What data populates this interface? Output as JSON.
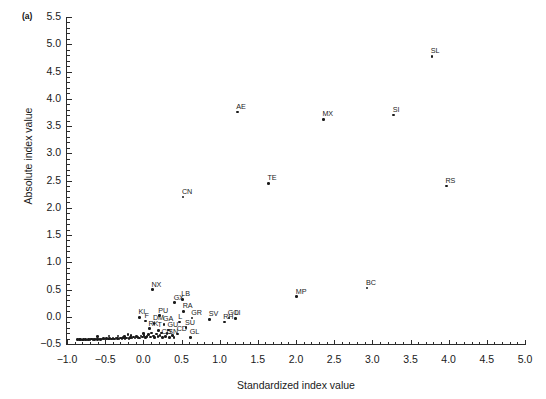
{
  "panel": {
    "label": "(a)"
  },
  "chart_data": {
    "type": "scatter",
    "title": "",
    "panel_label": "(a)",
    "xlabel": "Standardized index value",
    "ylabel": "Absolute index value",
    "xlim": [
      -1.0,
      5.0
    ],
    "ylim": [
      -0.5,
      5.5
    ],
    "xticks": [
      "-1.0",
      "-0.5",
      "0.0",
      "0.5",
      "1.0",
      "1.5",
      "2.0",
      "2.5",
      "3.0",
      "3.5",
      "4.0",
      "4.5",
      "5.0"
    ],
    "xtick_values": [
      -1.0,
      -0.5,
      0.0,
      0.5,
      1.0,
      1.5,
      2.0,
      2.5,
      3.0,
      3.5,
      4.0,
      4.5,
      5.0
    ],
    "yticks": [
      "5.5",
      "5.0",
      "4.5",
      "4.0",
      "3.5",
      "3.0",
      "2.5",
      "2.0",
      "1.5",
      "1.0",
      "0.5",
      "0.0",
      "-0.5"
    ],
    "ytick_values": [
      5.5,
      5.0,
      4.5,
      4.0,
      3.5,
      3.0,
      2.5,
      2.0,
      1.5,
      1.0,
      0.5,
      0.0,
      -0.5
    ],
    "minor_ticks": true,
    "grid": false,
    "legend": "none",
    "marker": "filled-circle",
    "marker_color": "#1a1a1a",
    "labeled_points": [
      {
        "label": "SL",
        "x": 3.78,
        "y": 4.78
      },
      {
        "label": "SI",
        "x": 3.28,
        "y": 3.7
      },
      {
        "label": "MX",
        "x": 2.36,
        "y": 3.62
      },
      {
        "label": "AE",
        "x": 1.23,
        "y": 3.76
      },
      {
        "label": "TE",
        "x": 1.64,
        "y": 2.45
      },
      {
        "label": "RS",
        "x": 3.97,
        "y": 2.4
      },
      {
        "label": "CN",
        "x": 0.52,
        "y": 2.2
      },
      {
        "label": "BC",
        "x": 2.93,
        "y": 0.53
      },
      {
        "label": "MP",
        "x": 2.01,
        "y": 0.37
      },
      {
        "label": "NX",
        "x": 0.12,
        "y": 0.5
      },
      {
        "label": "GX",
        "x": 0.41,
        "y": 0.26
      },
      {
        "label": "LB",
        "x": 0.51,
        "y": 0.32
      },
      {
        "label": "RA",
        "x": 0.53,
        "y": 0.1
      },
      {
        "label": "GR",
        "x": 0.64,
        "y": -0.02
      },
      {
        "label": "SV",
        "x": 0.87,
        "y": -0.05
      },
      {
        "label": "GO",
        "x": 1.12,
        "y": -0.02
      },
      {
        "label": "LI",
        "x": 1.21,
        "y": -0.03
      },
      {
        "label": "RH",
        "x": 1.06,
        "y": -0.1
      },
      {
        "label": "PU",
        "x": 0.21,
        "y": 0.02
      },
      {
        "label": "KI",
        "x": -0.05,
        "y": -0.01
      },
      {
        "label": "F",
        "x": 0.03,
        "y": -0.08
      },
      {
        "label": "DM",
        "x": 0.14,
        "y": -0.12
      },
      {
        "label": "GA",
        "x": 0.27,
        "y": -0.14
      },
      {
        "label": "L",
        "x": 0.47,
        "y": -0.1
      },
      {
        "label": "RK",
        "x": 0.08,
        "y": -0.22
      },
      {
        "label": "T",
        "x": 0.2,
        "y": -0.25
      },
      {
        "label": "GU",
        "x": 0.33,
        "y": -0.24
      },
      {
        "label": "SU",
        "x": 0.56,
        "y": -0.2
      },
      {
        "label": "CD",
        "x": 0.45,
        "y": -0.32
      },
      {
        "label": "CU",
        "x": 0.25,
        "y": -0.38
      },
      {
        "label": "SN",
        "x": 0.34,
        "y": -0.38
      },
      {
        "label": "GL",
        "x": 0.62,
        "y": -0.38
      }
    ],
    "unlabeled_points": [
      {
        "x": -0.86,
        "y": -0.42
      },
      {
        "x": -0.84,
        "y": -0.42
      },
      {
        "x": -0.82,
        "y": -0.42
      },
      {
        "x": -0.8,
        "y": -0.43
      },
      {
        "x": -0.78,
        "y": -0.42
      },
      {
        "x": -0.76,
        "y": -0.42
      },
      {
        "x": -0.74,
        "y": -0.43
      },
      {
        "x": -0.72,
        "y": -0.42
      },
      {
        "x": -0.7,
        "y": -0.42
      },
      {
        "x": -0.68,
        "y": -0.41
      },
      {
        "x": -0.66,
        "y": -0.42
      },
      {
        "x": -0.64,
        "y": -0.42
      },
      {
        "x": -0.62,
        "y": -0.41
      },
      {
        "x": -0.6,
        "y": -0.42
      },
      {
        "x": -0.58,
        "y": -0.41
      },
      {
        "x": -0.56,
        "y": -0.42
      },
      {
        "x": -0.54,
        "y": -0.41
      },
      {
        "x": -0.52,
        "y": -0.4
      },
      {
        "x": -0.5,
        "y": -0.41
      },
      {
        "x": -0.48,
        "y": -0.4
      },
      {
        "x": -0.46,
        "y": -0.41
      },
      {
        "x": -0.44,
        "y": -0.4
      },
      {
        "x": -0.42,
        "y": -0.41
      },
      {
        "x": -0.4,
        "y": -0.4
      },
      {
        "x": -0.38,
        "y": -0.41
      },
      {
        "x": -0.36,
        "y": -0.39
      },
      {
        "x": -0.34,
        "y": -0.4
      },
      {
        "x": -0.32,
        "y": -0.41
      },
      {
        "x": -0.3,
        "y": -0.39
      },
      {
        "x": -0.28,
        "y": -0.4
      },
      {
        "x": -0.26,
        "y": -0.38
      },
      {
        "x": -0.24,
        "y": -0.4
      },
      {
        "x": -0.22,
        "y": -0.39
      },
      {
        "x": -0.2,
        "y": -0.33
      },
      {
        "x": -0.19,
        "y": -0.4
      },
      {
        "x": -0.17,
        "y": -0.38
      },
      {
        "x": -0.15,
        "y": -0.39
      },
      {
        "x": -0.13,
        "y": -0.37
      },
      {
        "x": -0.11,
        "y": -0.39
      },
      {
        "x": -0.09,
        "y": -0.36
      },
      {
        "x": -0.07,
        "y": -0.38
      },
      {
        "x": -0.05,
        "y": -0.39
      },
      {
        "x": -0.03,
        "y": -0.35
      },
      {
        "x": -0.01,
        "y": -0.37
      },
      {
        "x": 0.01,
        "y": -0.34
      },
      {
        "x": 0.03,
        "y": -0.38
      },
      {
        "x": 0.05,
        "y": -0.36
      },
      {
        "x": 0.07,
        "y": -0.33
      },
      {
        "x": 0.09,
        "y": -0.37
      },
      {
        "x": 0.11,
        "y": -0.3
      },
      {
        "x": 0.13,
        "y": -0.35
      },
      {
        "x": 0.15,
        "y": -0.38
      },
      {
        "x": 0.17,
        "y": -0.32
      },
      {
        "x": 0.19,
        "y": -0.36
      },
      {
        "x": 0.22,
        "y": -0.34
      },
      {
        "x": 0.24,
        "y": -0.3
      },
      {
        "x": 0.29,
        "y": -0.36
      },
      {
        "x": 0.31,
        "y": -0.31
      },
      {
        "x": 0.38,
        "y": -0.34
      },
      {
        "x": 0.4,
        "y": -0.38
      },
      {
        "x": -0.6,
        "y": -0.36
      },
      {
        "x": -0.45,
        "y": -0.35
      },
      {
        "x": -0.33,
        "y": -0.35
      },
      {
        "x": -0.25,
        "y": -0.36
      },
      {
        "x": -0.16,
        "y": -0.34
      },
      {
        "x": 0.0,
        "y": -0.31
      }
    ]
  }
}
